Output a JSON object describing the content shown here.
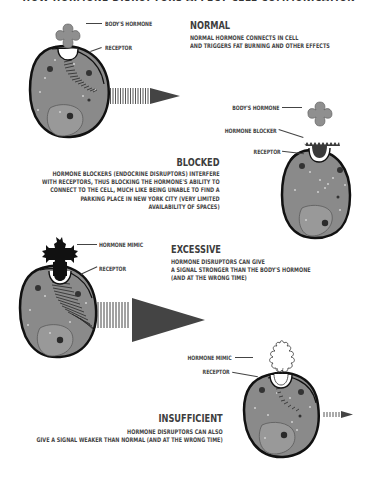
{
  "header": {
    "title_clipped": "HOW HORMONE DISRUPTORS AFFECT CELL COMMUNICATION"
  },
  "colors": {
    "cell_fill": "#8a8a8a",
    "cell_outline": "#1a1a1a",
    "hormone_fill": "#8f8f8f",
    "blocker_fill": "#3a3a3a",
    "mimic_fill": "#111111",
    "arrow_fill": "#444444",
    "dot_light": "#c8c8c8",
    "dot_dark": "#333333",
    "text": "#444444"
  },
  "panels": [
    {
      "id": "normal",
      "title": "NORMAL",
      "description": [
        "NORMAL HORMONE CONNECTS IN CELL",
        "AND TRIGGERS FAT BURNING AND OTHER EFFECTS"
      ],
      "labels": [
        "BODY'S HORMONE",
        "RECEPTOR"
      ],
      "signal_strength": "normal"
    },
    {
      "id": "blocked",
      "title": "BLOCKED",
      "description": [
        "HORMONE BLOCKERS (ENDOCRINE DISRUPTORS) INTERFERE",
        "WITH RECEPTORS, THUS BLOCKING THE HORMONE'S ABILITY TO",
        "CONNECT TO THE CELL, MUCH LIKE BEING UNABLE TO FIND A",
        "PARKING PLACE IN NEW YORK CITY (VERY LIMITED",
        "AVAILABILITY OF SPACES)"
      ],
      "labels": [
        "BODY'S HORMONE",
        "HORMONE BLOCKER",
        "RECEPTOR"
      ],
      "signal_strength": "none"
    },
    {
      "id": "excessive",
      "title": "EXCESSIVE",
      "description": [
        "HORMONE DISRUPTORS CAN GIVE",
        "A SIGNAL STRONGER THAN THE BODY'S HORMONE",
        "(AND AT THE WRONG TIME)"
      ],
      "labels": [
        "HORMONE MIMIC",
        "RECEPTOR"
      ],
      "signal_strength": "strong"
    },
    {
      "id": "insufficient",
      "title": "INSUFFICIENT",
      "description": [
        "HORMONE DISRUPTORS CAN ALSO",
        "GIVE A SIGNAL WEAKER THAN NORMAL (AND AT THE WRONG TIME)"
      ],
      "labels": [
        "HORMONE MIMIC",
        "RECEPTOR"
      ],
      "signal_strength": "weak"
    }
  ]
}
